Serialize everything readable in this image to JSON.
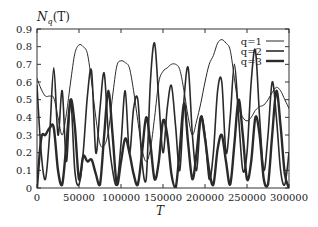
{
  "chart_data": {
    "type": "line",
    "title": "",
    "ylabel": "N_q(T)",
    "xlabel": "T",
    "xlim": [
      0,
      300000
    ],
    "ylim": [
      0,
      0.9
    ],
    "grid": false,
    "legend_position": "upper right (inside)",
    "x_ticks": [
      0,
      50000,
      100000,
      150000,
      200000,
      250000,
      300000
    ],
    "x_tick_labels": [
      "0",
      "50000",
      "100000",
      "150000",
      "200000",
      "250000",
      "300000"
    ],
    "y_ticks": [
      0,
      0.1,
      0.2,
      0.3,
      0.4,
      0.5,
      0.6,
      0.7,
      0.8,
      0.9
    ],
    "y_tick_labels": [
      "0",
      "0.1",
      "0.2",
      "0.3",
      "0.4",
      "0.5",
      "0.6",
      "0.7",
      "0.8",
      "0.9"
    ],
    "series": [
      {
        "name": "q=1",
        "line_width": 1,
        "x": [
          0,
          5000,
          10000,
          15000,
          20000,
          25000,
          30000,
          35000,
          40000,
          45000,
          50000,
          55000,
          60000,
          65000,
          70000,
          75000,
          80000,
          85000,
          90000,
          95000,
          100000,
          105000,
          110000,
          115000,
          120000,
          125000,
          130000,
          135000,
          140000,
          145000,
          150000,
          155000,
          160000,
          165000,
          170000,
          175000,
          180000,
          185000,
          190000,
          195000,
          200000,
          205000,
          210000,
          215000,
          220000,
          225000,
          230000,
          235000,
          240000,
          245000,
          250000,
          255000,
          260000,
          265000,
          270000,
          275000,
          280000,
          285000,
          290000,
          295000,
          300000
        ],
        "values": [
          0.62,
          0.56,
          0.52,
          0.52,
          0.51,
          0.4,
          0.3,
          0.42,
          0.6,
          0.76,
          0.81,
          0.8,
          0.76,
          0.6,
          0.4,
          0.25,
          0.24,
          0.32,
          0.52,
          0.69,
          0.72,
          0.71,
          0.68,
          0.55,
          0.38,
          0.22,
          0.15,
          0.22,
          0.4,
          0.6,
          0.66,
          0.68,
          0.7,
          0.7,
          0.67,
          0.55,
          0.4,
          0.3,
          0.38,
          0.48,
          0.6,
          0.7,
          0.75,
          0.82,
          0.84,
          0.82,
          0.78,
          0.62,
          0.46,
          0.4,
          0.38,
          0.4,
          0.44,
          0.46,
          0.47,
          0.5,
          0.54,
          0.57,
          0.55,
          0.5,
          0.45
        ]
      },
      {
        "name": "q=2",
        "line_width": 1.6,
        "x": [
          0,
          5000,
          10000,
          15000,
          20000,
          25000,
          30000,
          35000,
          40000,
          45000,
          50000,
          55000,
          60000,
          65000,
          70000,
          75000,
          80000,
          85000,
          90000,
          95000,
          100000,
          105000,
          110000,
          115000,
          120000,
          125000,
          130000,
          135000,
          140000,
          145000,
          150000,
          155000,
          160000,
          165000,
          170000,
          175000,
          180000,
          185000,
          190000,
          195000,
          200000,
          205000,
          210000,
          215000,
          220000,
          225000,
          230000,
          235000,
          240000,
          245000,
          250000,
          255000,
          260000,
          265000,
          270000,
          275000,
          280000,
          285000,
          290000,
          295000,
          300000
        ],
        "values": [
          0.58,
          0.2,
          0.05,
          0.3,
          0.68,
          0.3,
          0.55,
          0.15,
          0.5,
          0.1,
          0.02,
          0.2,
          0.52,
          0.66,
          0.2,
          0.45,
          0.65,
          0.3,
          0.1,
          0.02,
          0.25,
          0.55,
          0.2,
          0.45,
          0.5,
          0.15,
          0.05,
          0.6,
          0.82,
          0.5,
          0.2,
          0.45,
          0.58,
          0.35,
          0.1,
          0.5,
          0.68,
          0.3,
          0.1,
          0.4,
          0.3,
          0.05,
          0.2,
          0.55,
          0.6,
          0.2,
          0.4,
          0.7,
          0.4,
          0.1,
          0.2,
          0.6,
          0.78,
          0.4,
          0.1,
          0.3,
          0.6,
          0.4,
          0.1,
          0.02,
          0.2
        ]
      },
      {
        "name": "q=3",
        "line_width": 2.4,
        "x": [
          0,
          5000,
          10000,
          15000,
          20000,
          25000,
          30000,
          35000,
          40000,
          45000,
          50000,
          55000,
          60000,
          65000,
          70000,
          75000,
          80000,
          85000,
          90000,
          95000,
          100000,
          105000,
          110000,
          115000,
          120000,
          125000,
          130000,
          135000,
          140000,
          145000,
          150000,
          155000,
          160000,
          165000,
          170000,
          175000,
          180000,
          185000,
          190000,
          195000,
          200000,
          205000,
          210000,
          215000,
          220000,
          225000,
          230000,
          235000,
          240000,
          245000,
          250000,
          255000,
          260000,
          265000,
          270000,
          275000,
          280000,
          285000,
          290000,
          295000,
          300000
        ],
        "values": [
          0.0,
          0.28,
          0.3,
          0.34,
          0.34,
          0.1,
          0.02,
          0.25,
          0.5,
          0.35,
          0.05,
          0.18,
          0.15,
          0.16,
          0.08,
          0.02,
          0.3,
          0.55,
          0.3,
          0.02,
          0.15,
          0.28,
          0.2,
          0.08,
          0.02,
          0.2,
          0.4,
          0.25,
          0.05,
          0.15,
          0.38,
          0.3,
          0.08,
          0.0,
          0.22,
          0.48,
          0.25,
          0.05,
          0.2,
          0.4,
          0.28,
          0.1,
          0.02,
          0.22,
          0.3,
          0.15,
          0.02,
          0.25,
          0.5,
          0.3,
          0.05,
          0.15,
          0.4,
          0.3,
          0.05,
          0.02,
          0.3,
          0.55,
          0.35,
          0.08,
          0.0
        ]
      }
    ]
  },
  "legend": {
    "items": [
      {
        "label": "q=1",
        "line_width": 1
      },
      {
        "label": "q=2",
        "line_width": 1.6
      },
      {
        "label": "q=3",
        "line_width": 2.4
      }
    ]
  },
  "axes": {
    "ylabel": "N_q(T)",
    "ylabel_main": "N",
    "ylabel_sub": "q",
    "ylabel_paren": "(T)",
    "xlabel": "T"
  },
  "colors": {
    "line": "#2a2a2a",
    "frame": "#333333",
    "background": "#ffffff"
  }
}
